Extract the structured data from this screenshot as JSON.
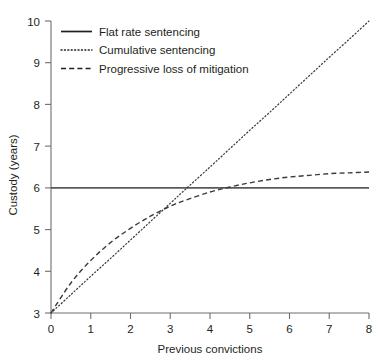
{
  "chart_data": {
    "type": "line",
    "title": "",
    "xlabel": "Previous convictions",
    "ylabel": "Custody (years)",
    "xlim": [
      0,
      8
    ],
    "ylim": [
      3,
      10
    ],
    "xticks": [
      "0",
      "1",
      "2",
      "3",
      "4",
      "5",
      "6",
      "7",
      "8"
    ],
    "yticks": [
      "3",
      "4",
      "5",
      "6",
      "7",
      "8",
      "9",
      "10"
    ],
    "grid": false,
    "legend_position": "upper-left-inside",
    "x": [
      0,
      0.5,
      1,
      1.5,
      2,
      2.5,
      3,
      3.4,
      4,
      4.5,
      5,
      5.5,
      6,
      6.5,
      7,
      7.5,
      8
    ],
    "series": [
      {
        "name": "Flat rate sentencing",
        "style": "solid",
        "color": "#58595b",
        "values": [
          6,
          6,
          6,
          6,
          6,
          6,
          6,
          6,
          6,
          6,
          6,
          6,
          6,
          6,
          6,
          6,
          6
        ]
      },
      {
        "name": "Cumulative sentencing",
        "style": "dotted",
        "color": "#3a3a3c",
        "values": [
          3,
          3.44,
          3.88,
          4.31,
          4.75,
          5.19,
          5.63,
          5.98,
          6.5,
          6.94,
          7.38,
          7.81,
          8.25,
          8.69,
          9.13,
          9.56,
          10
        ]
      },
      {
        "name": "Progressive loss of mitigation",
        "style": "dashed",
        "color": "#3a3a3c",
        "values": [
          3,
          3.72,
          4.26,
          4.69,
          5.03,
          5.32,
          5.56,
          5.71,
          5.9,
          6.02,
          6.12,
          6.2,
          6.26,
          6.3,
          6.34,
          6.36,
          6.38
        ]
      }
    ],
    "annotations": [
      {
        "label": "crossing-point",
        "x": 3.4,
        "y": 6
      }
    ]
  }
}
